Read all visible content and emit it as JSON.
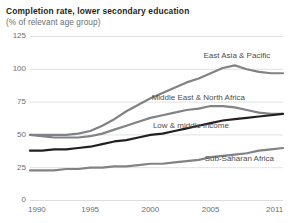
{
  "chart_data": {
    "type": "line",
    "title": "Completion rate, lower secondary education",
    "subtitle": "(% of relevant age group)",
    "xlabel": "",
    "ylabel": "",
    "ylim": [
      0,
      125
    ],
    "xlim": [
      1990,
      2011
    ],
    "yticks": [
      0,
      25,
      50,
      75,
      100,
      125
    ],
    "ytick_labels": [
      "0",
      "25",
      "50",
      "75",
      "100",
      "125"
    ],
    "xticks": [
      1990,
      1995,
      2000,
      2005,
      2011
    ],
    "xtick_labels": [
      "1990",
      "1995",
      "2000",
      "2005",
      "2011"
    ],
    "grid": true,
    "grid_axis": "y",
    "grid_color": "#d9d9d9",
    "legend": "inline-labels",
    "x": [
      1990,
      1991,
      1992,
      1993,
      1994,
      1995,
      1996,
      1997,
      1998,
      1999,
      2000,
      2001,
      2002,
      2003,
      2004,
      2005,
      2006,
      2007,
      2008,
      2009,
      2010,
      2011
    ],
    "series": [
      {
        "name": "East Asia & Pacific",
        "color": "#808285",
        "width": 2.2,
        "label_x": 2004.4,
        "label_y": 110,
        "values": [
          50,
          50,
          50,
          50,
          51,
          53,
          57,
          62,
          68,
          73,
          78,
          82,
          86,
          90,
          93,
          97,
          101,
          103,
          100,
          98,
          97,
          97
        ]
      },
      {
        "name": "Middle East & North Africa",
        "color": "#808285",
        "width": 2.2,
        "label_x": 2000.1,
        "label_y": 78,
        "values": [
          50,
          49,
          48,
          48,
          48,
          49,
          51,
          54,
          57,
          60,
          63,
          65,
          67,
          69,
          70,
          72,
          72,
          71,
          69,
          67,
          66,
          66
        ]
      },
      {
        "name": "Low & middle income",
        "color": "#231f20",
        "width": 2.2,
        "label_x": 2000.2,
        "label_y": 57,
        "values": [
          38,
          38,
          39,
          39,
          40,
          41,
          43,
          45,
          46,
          48,
          50,
          51,
          53,
          55,
          57,
          59,
          61,
          62,
          63,
          64,
          65,
          66
        ]
      },
      {
        "name": "Sub-Saharan Africa",
        "color": "#808285",
        "width": 2.2,
        "label_x": 2004.5,
        "label_y": 32,
        "values": [
          23,
          23,
          23,
          24,
          24,
          25,
          25,
          26,
          26,
          27,
          28,
          28,
          29,
          30,
          31,
          33,
          34,
          35,
          36,
          38,
          39,
          40
        ]
      }
    ]
  }
}
